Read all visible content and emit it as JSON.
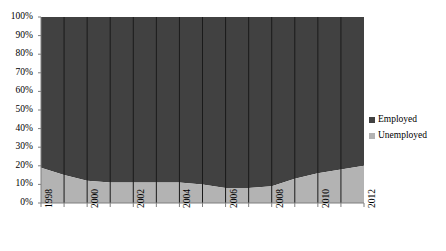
{
  "chart_data": {
    "type": "area",
    "stacked": "percent",
    "title": "",
    "xlabel": "",
    "ylabel": "",
    "x": [
      1998,
      1999,
      2000,
      2001,
      2002,
      2003,
      2004,
      2005,
      2006,
      2007,
      2008,
      2009,
      2010,
      2011,
      2012
    ],
    "x_tick_labels": [
      "1998",
      "",
      "2000",
      "",
      "2002",
      "",
      "2004",
      "",
      "2006",
      "",
      "2008",
      "",
      "2010",
      "",
      "2012"
    ],
    "x_labels_shown": [
      "1998",
      "2000",
      "2002",
      "2004",
      "2006",
      "2008",
      "2010",
      "2012"
    ],
    "y_tick_labels": [
      "100%",
      "90%",
      "80%",
      "70%",
      "60%",
      "50%",
      "40%",
      "30%",
      "20%",
      "10%",
      "0%"
    ],
    "y_tick_values": [
      100,
      90,
      80,
      70,
      60,
      50,
      40,
      30,
      20,
      10,
      0
    ],
    "ylim": [
      0,
      100
    ],
    "grid": "vertical-only",
    "legend_position": "right",
    "series": [
      {
        "name": "Employed",
        "color": "#414141",
        "values": [
          81,
          85,
          88,
          89,
          89,
          89,
          89,
          90,
          92,
          92,
          91,
          87,
          84,
          82,
          80
        ]
      },
      {
        "name": "Unemployed",
        "color": "#b3b3b3",
        "values": [
          19,
          15,
          12,
          11,
          11,
          11,
          11,
          10,
          8,
          8,
          9,
          13,
          16,
          18,
          20
        ]
      }
    ]
  },
  "legend": {
    "items": [
      {
        "label": "Employed",
        "color": "#414141",
        "marker": "square-swatch-icon"
      },
      {
        "label": "Unemployed",
        "color": "#b3b3b3",
        "marker": "square-swatch-icon"
      }
    ]
  },
  "plot": {
    "geometry": {
      "left": 41,
      "right": 364,
      "top": 17,
      "bottom": 203
    },
    "axis_color": "#7f7f7f",
    "gridline_color": "#1a1a1a",
    "background": "#ffffff"
  }
}
